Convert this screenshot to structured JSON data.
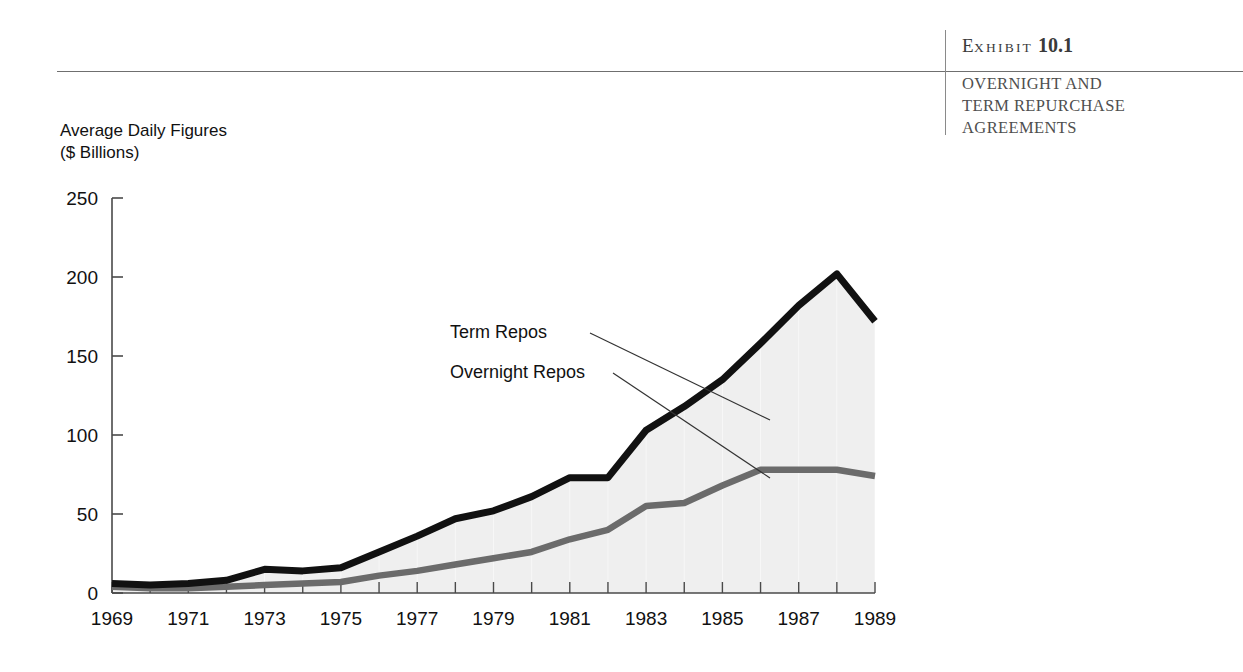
{
  "header": {
    "exhibit_word_first": "E",
    "exhibit_word_rest": "XHIBIT",
    "exhibit_number": "10.1",
    "subtitle_line1": "OVERNIGHT AND",
    "subtitle_line2": "TERM REPURCHASE",
    "subtitle_line3": "AGREEMENTS"
  },
  "chart_data": {
    "type": "area",
    "title": "",
    "subtitle": "",
    "xlabel": "",
    "ylabel": "Average Daily Figures",
    "ylabel_line2": "($ Billions)",
    "ylim": [
      0,
      250
    ],
    "xlim": [
      1969,
      1989
    ],
    "grid": false,
    "legend_position": "inline-annotations",
    "ytick_labels": [
      "250",
      "200",
      "150",
      "100",
      "50",
      "0"
    ],
    "ytick_values": [
      250,
      200,
      150,
      100,
      50,
      0
    ],
    "xtick_labels": [
      "1969",
      "1971",
      "1973",
      "1975",
      "1977",
      "1979",
      "1981",
      "1983",
      "1985",
      "1987",
      "1989"
    ],
    "xtick_values": [
      1969,
      1971,
      1973,
      1975,
      1977,
      1979,
      1981,
      1983,
      1985,
      1987,
      1989
    ],
    "x": [
      1969,
      1970,
      1971,
      1972,
      1973,
      1974,
      1975,
      1976,
      1977,
      1978,
      1979,
      1980,
      1981,
      1982,
      1983,
      1984,
      1985,
      1986,
      1987,
      1988,
      1989
    ],
    "series": [
      {
        "name": "Total (Overnight + Term Repos)",
        "color": "#111111",
        "values": [
          6,
          5,
          6,
          8,
          15,
          14,
          16,
          26,
          36,
          47,
          52,
          61,
          73,
          73,
          103,
          118,
          135,
          158,
          182,
          202,
          172
        ]
      },
      {
        "name": "Overnight Repos",
        "color": "#6b6b6b",
        "values": [
          4,
          3,
          3,
          4,
          5,
          6,
          7,
          11,
          14,
          18,
          22,
          26,
          34,
          40,
          55,
          57,
          68,
          78,
          78,
          78,
          74
        ]
      }
    ],
    "annotations": [
      {
        "label": "Term Repos",
        "x": 450,
        "y": 338
      },
      {
        "label": "Overnight Repos",
        "x": 450,
        "y": 378
      }
    ],
    "fill_color": "#efefef",
    "axis_color": "#4a4a4a"
  }
}
